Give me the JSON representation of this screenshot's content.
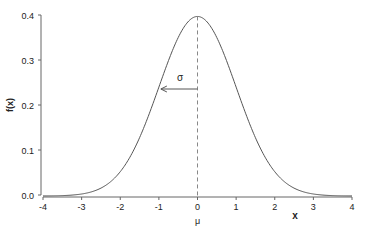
{
  "chart_data": {
    "type": "line",
    "title": "",
    "xlabel": "x",
    "ylabel": "f(x)",
    "xlim": [
      -4,
      4
    ],
    "ylim": [
      0,
      0.4
    ],
    "x_ticks": [
      "-4",
      "-3",
      "-2",
      "-1",
      "0",
      "1",
      "2",
      "3",
      "4"
    ],
    "y_ticks": [
      "0.0",
      "0.1",
      "0.2",
      "0.3",
      "0.4"
    ],
    "grid": false,
    "series": [
      {
        "name": "Normal density N(0,1)",
        "function": "standard normal pdf",
        "mean": 0,
        "sd": 1,
        "x": [
          -4,
          -3,
          -2,
          -1,
          0,
          1,
          2,
          3,
          4
        ],
        "values": [
          0.0001,
          0.0044,
          0.054,
          0.242,
          0.399,
          0.242,
          0.054,
          0.0044,
          0.0001
        ]
      }
    ],
    "annotations": [
      {
        "type": "dashed-vline",
        "x": 0,
        "label": "μ"
      },
      {
        "type": "arrow",
        "from": [
          0,
          0.242
        ],
        "to": [
          -1,
          0.242
        ],
        "label": "σ"
      }
    ]
  },
  "labels": {
    "xlabel": "x",
    "ylabel": "f(x)",
    "mu": "μ",
    "sigma": "σ"
  }
}
